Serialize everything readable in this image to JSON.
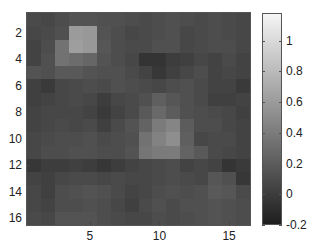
{
  "chart_data": {
    "type": "heatmap",
    "title": "",
    "xlabel": "",
    "ylabel": "",
    "colormap": "gray",
    "clim": [
      -0.2,
      1.18
    ],
    "x_ticks": [
      5,
      10,
      15
    ],
    "y_ticks": [
      2,
      4,
      6,
      8,
      10,
      12,
      14,
      16
    ],
    "colorbar_ticks": [
      -0.2,
      0,
      0.2,
      0.4,
      0.6,
      0.8,
      1
    ],
    "colorbar_tick_labels": [
      "-0.2",
      "0",
      "0.2",
      "0.4",
      "0.6",
      "0.8",
      "1"
    ],
    "rows": 16,
    "cols": 16,
    "values": [
      [
        0.08,
        0.06,
        0.1,
        0.14,
        0.14,
        0.12,
        0.12,
        0.1,
        0.08,
        0.1,
        0.12,
        0.1,
        0.08,
        0.1,
        0.08,
        0.06
      ],
      [
        0.06,
        0.08,
        0.12,
        0.6,
        0.58,
        0.14,
        0.1,
        0.06,
        0.08,
        0.1,
        0.12,
        0.06,
        0.08,
        0.1,
        0.08,
        0.06
      ],
      [
        0.04,
        0.1,
        0.34,
        0.62,
        0.58,
        0.16,
        0.1,
        0.08,
        0.08,
        0.12,
        0.12,
        0.06,
        0.08,
        0.1,
        0.1,
        0.06
      ],
      [
        0.04,
        0.12,
        0.34,
        0.3,
        0.26,
        0.14,
        0.1,
        0.06,
        -0.06,
        -0.06,
        0.0,
        0.02,
        0.06,
        0.04,
        0.08,
        0.04
      ],
      [
        0.14,
        0.12,
        0.18,
        0.18,
        0.14,
        0.12,
        0.12,
        0.08,
        0.04,
        -0.04,
        0.02,
        0.06,
        0.1,
        0.04,
        0.06,
        0.04
      ],
      [
        0.02,
        -0.02,
        0.06,
        0.08,
        0.1,
        0.08,
        0.12,
        0.1,
        0.08,
        0.06,
        0.1,
        0.12,
        0.08,
        0.04,
        0.04,
        -0.02
      ],
      [
        0.02,
        0.04,
        0.06,
        0.08,
        0.06,
        0.0,
        0.06,
        0.08,
        0.12,
        0.22,
        0.16,
        0.12,
        0.08,
        0.02,
        0.02,
        0.04
      ],
      [
        0.04,
        0.06,
        0.06,
        0.06,
        0.04,
        -0.02,
        0.04,
        0.08,
        0.18,
        0.28,
        0.2,
        0.12,
        0.1,
        0.08,
        0.06,
        0.02
      ],
      [
        0.04,
        0.06,
        0.08,
        0.06,
        0.08,
        0.02,
        0.08,
        0.14,
        0.24,
        0.4,
        0.46,
        0.2,
        0.1,
        0.1,
        0.06,
        0.04
      ],
      [
        0.06,
        0.08,
        0.1,
        0.1,
        0.12,
        0.08,
        0.1,
        0.12,
        0.34,
        0.44,
        0.52,
        0.22,
        0.06,
        0.08,
        0.08,
        0.04
      ],
      [
        0.06,
        0.1,
        0.1,
        0.12,
        0.12,
        0.1,
        0.1,
        0.14,
        0.36,
        0.4,
        0.4,
        0.24,
        0.18,
        0.08,
        0.06,
        0.04
      ],
      [
        -0.04,
        0.0,
        0.0,
        0.02,
        0.0,
        -0.04,
        0.0,
        0.04,
        0.06,
        0.08,
        0.1,
        0.04,
        0.06,
        0.04,
        -0.06,
        -0.02
      ],
      [
        0.04,
        0.02,
        0.06,
        0.08,
        0.08,
        0.06,
        0.08,
        0.06,
        0.06,
        0.08,
        0.1,
        0.08,
        0.06,
        0.16,
        0.12,
        -0.04
      ],
      [
        0.06,
        0.02,
        0.1,
        0.12,
        0.14,
        0.12,
        0.08,
        0.04,
        0.06,
        0.1,
        0.12,
        0.1,
        0.12,
        0.18,
        0.16,
        0.08
      ],
      [
        0.06,
        0.04,
        0.1,
        0.1,
        0.12,
        0.1,
        0.06,
        0.02,
        0.08,
        0.12,
        0.08,
        0.12,
        0.12,
        0.14,
        0.12,
        0.1
      ],
      [
        0.08,
        0.06,
        0.14,
        0.14,
        0.14,
        0.1,
        0.08,
        0.06,
        0.06,
        0.1,
        0.08,
        0.1,
        0.12,
        0.14,
        0.12,
        0.1
      ]
    ]
  }
}
